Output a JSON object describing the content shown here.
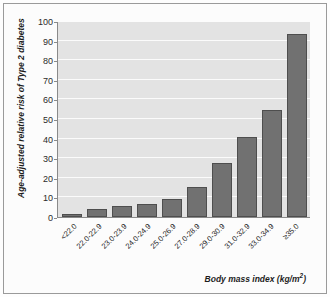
{
  "chart_data": {
    "type": "bar",
    "title": "",
    "subtitle": "",
    "xlabel": "Body mass index (kg/m²)",
    "ylabel": "Age-adjusted relative risk of Type 2 diabetes",
    "categories": [
      "<22.0",
      "22.0-22.9",
      "23.0-23.9",
      "24.0-24.9",
      "25.0-26.9",
      "27.0-28.9",
      "29.0-30.9",
      "31.0-32.9",
      "33.0-34.9",
      "≥35.0"
    ],
    "values": [
      1.5,
      4.3,
      5.5,
      6.5,
      9,
      15.5,
      27.5,
      41,
      54.5,
      93.5
    ],
    "ylim": [
      0,
      100
    ],
    "yticks": [
      0,
      10,
      20,
      30,
      40,
      50,
      60,
      70,
      80,
      90,
      100
    ],
    "ytick_labels": [
      "0",
      "10",
      "20",
      "30",
      "40",
      "50",
      "60",
      "70",
      "80",
      "90",
      "100"
    ],
    "grid": true,
    "grid_axis": "y",
    "legend": false,
    "legend_position": "none",
    "series": [
      {
        "name": "Age-adjusted relative risk of Type 2 diabetes",
        "values": [
          1.5,
          4.3,
          5.5,
          6.5,
          9,
          15.5,
          27.5,
          41,
          54.5,
          93.5
        ]
      }
    ],
    "colors": {
      "bar_fill": "#717171",
      "bar_border": "#4e4e4e",
      "plot_background": "#e3e3e3",
      "gridline": "#fbfbfb",
      "axis": "#8a8a8a",
      "text": "#1d1d1d",
      "figure_border": "#9a9a9a",
      "figure_background": "#fcfcfc"
    }
  }
}
